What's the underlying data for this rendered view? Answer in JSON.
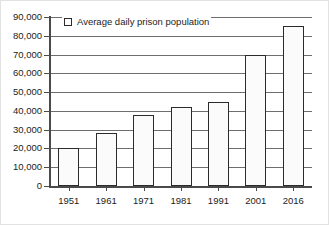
{
  "chart_data": {
    "type": "bar",
    "title": "",
    "xlabel": "",
    "ylabel": "",
    "categories": [
      "1951",
      "1961",
      "1971",
      "1981",
      "1991",
      "2001",
      "2016"
    ],
    "values": [
      20000,
      28000,
      38000,
      42000,
      45000,
      70000,
      85000
    ],
    "series": [
      {
        "name": "Average daily prison population",
        "values": [
          20000,
          28000,
          38000,
          42000,
          45000,
          70000,
          85000
        ]
      }
    ],
    "ylim": [
      0,
      90000
    ],
    "ytick_values": [
      0,
      10000,
      20000,
      30000,
      40000,
      50000,
      60000,
      70000,
      80000,
      90000
    ],
    "ytick_labels": [
      "0",
      "10,000",
      "20,000",
      "30,000",
      "40,000",
      "50,000",
      "60,000",
      "70,000",
      "80,000",
      "90,000"
    ],
    "grid": true,
    "legend": {
      "position": "top-left-inside",
      "entries": [
        {
          "label": "Average daily prison population",
          "swatch_fill": "#ffffff",
          "swatch_border": "#2b2b2b"
        }
      ]
    },
    "colors": {
      "bar_fill": "#fbfbfb",
      "bar_border": "#2b2b2b",
      "gridline": "#6e6e6e",
      "axis": "#4a4a4a",
      "text": "#1c1c1c",
      "background": "#ffffff"
    }
  }
}
